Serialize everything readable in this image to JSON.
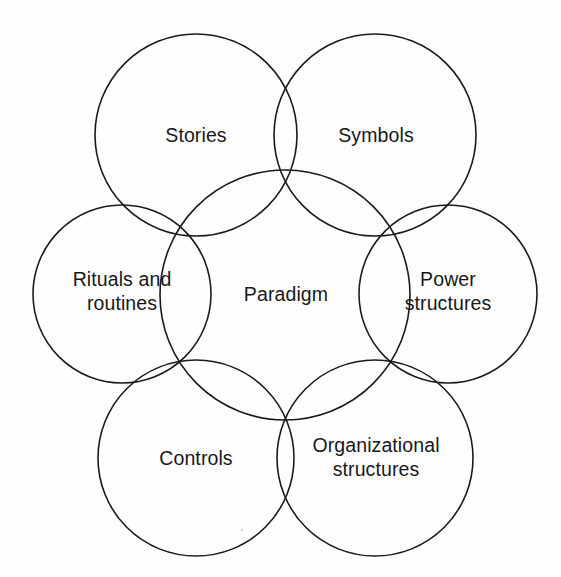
{
  "diagram": {
    "type": "venn-overlap-circles",
    "background_color": "#fefefe",
    "stroke_color": "#1a1a1a",
    "text_color": "#18181a",
    "nodes": [
      {
        "id": "stories",
        "label": "Stories",
        "cx": 196,
        "cy": 135,
        "r": 101,
        "label_x": 196,
        "label_y": 136
      },
      {
        "id": "symbols",
        "label": "Symbols",
        "cx": 375,
        "cy": 135,
        "r": 101,
        "label_x": 376,
        "label_y": 136
      },
      {
        "id": "rituals-and-routines",
        "label": "Rituals and\nroutines",
        "cx": 122,
        "cy": 294,
        "r": 89,
        "label_x": 122,
        "label_y": 292
      },
      {
        "id": "paradigm",
        "label": "Paradigm",
        "cx": 285,
        "cy": 295,
        "r": 125,
        "label_x": 286,
        "label_y": 295
      },
      {
        "id": "power-structures",
        "label": "Power\nstructures",
        "cx": 448,
        "cy": 294,
        "r": 89,
        "label_x": 448,
        "label_y": 292
      },
      {
        "id": "controls",
        "label": "Controls",
        "cx": 196,
        "cy": 458,
        "r": 98,
        "label_x": 196,
        "label_y": 459
      },
      {
        "id": "organizational-structures",
        "label": "Organizational\nstructures",
        "cx": 375,
        "cy": 458,
        "r": 98,
        "label_x": 376,
        "label_y": 458
      }
    ],
    "specks": [
      {
        "x": 241,
        "y": 529
      }
    ]
  }
}
